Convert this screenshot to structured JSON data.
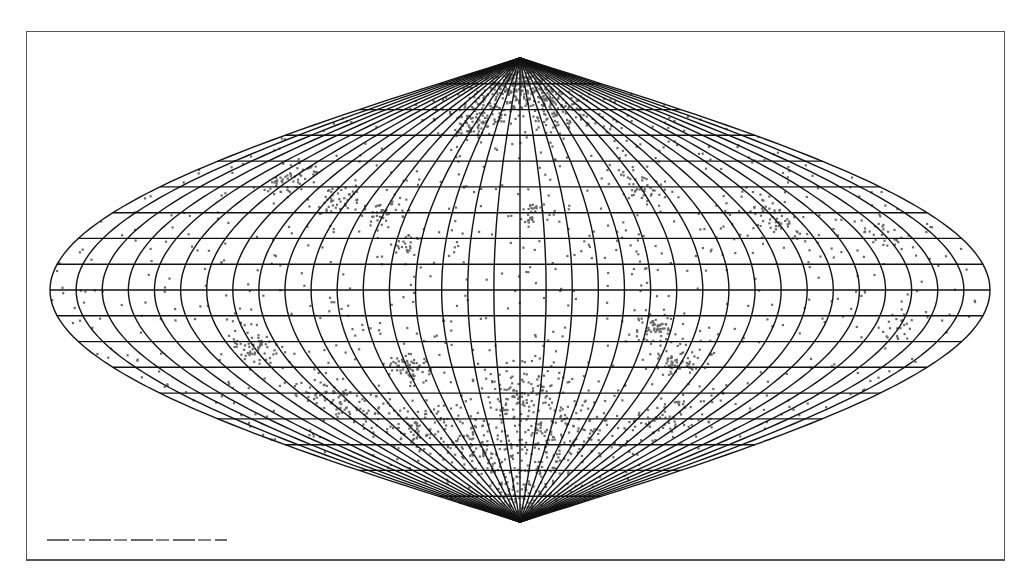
{
  "figure": {
    "caption": "Sinusoidal equal-area all-sky map with point distribution",
    "projection": "sinusoidal",
    "graticule_step_deg": 10
  },
  "layout": {
    "frame": {
      "x": 26,
      "y": 31,
      "w": 979,
      "h": 530
    },
    "center_x": 520,
    "equator_y": 290,
    "half_width": 470,
    "half_height": 232
  },
  "colors": {
    "grid": "#111111",
    "points": "#666666",
    "frame": "#555555",
    "background": "#ffffff"
  },
  "clusters": [
    {
      "lon": -10,
      "lat": 80,
      "spread": 9,
      "n": 260
    },
    {
      "lon": 15,
      "lat": 78,
      "spread": 9,
      "n": 160
    },
    {
      "lon": -40,
      "lat": 65,
      "spread": 6,
      "n": 90
    },
    {
      "lon": 40,
      "lat": 68,
      "spread": 6,
      "n": 70
    },
    {
      "lon": -120,
      "lat": 43,
      "spread": 4,
      "n": 40
    },
    {
      "lon": -85,
      "lat": 35,
      "spread": 4,
      "n": 40
    },
    {
      "lon": -60,
      "lat": 30,
      "spread": 4,
      "n": 35
    },
    {
      "lon": 5,
      "lat": 30,
      "spread": 3,
      "n": 25
    },
    {
      "lon": 110,
      "lat": 28,
      "spread": 5,
      "n": 45
    },
    {
      "lon": 60,
      "lat": 40,
      "spread": 4,
      "n": 30
    },
    {
      "lon": -45,
      "lat": 18,
      "spread": 3,
      "n": 25
    },
    {
      "lon": 55,
      "lat": -15,
      "spread": 4,
      "n": 55
    },
    {
      "lon": 70,
      "lat": -28,
      "spread": 5,
      "n": 60
    },
    {
      "lon": -50,
      "lat": -30,
      "spread": 4,
      "n": 60
    },
    {
      "lon": -110,
      "lat": -22,
      "spread": 5,
      "n": 55
    },
    {
      "lon": -95,
      "lat": -42,
      "spread": 6,
      "n": 70
    },
    {
      "lon": 0,
      "lat": -38,
      "spread": 8,
      "n": 110
    },
    {
      "lon": 30,
      "lat": -55,
      "spread": 10,
      "n": 140
    },
    {
      "lon": -30,
      "lat": -60,
      "spread": 10,
      "n": 140
    },
    {
      "lon": 0,
      "lat": -78,
      "spread": 8,
      "n": 110
    },
    {
      "lon": 90,
      "lat": -50,
      "spread": 8,
      "n": 70
    },
    {
      "lon": -70,
      "lat": -55,
      "spread": 8,
      "n": 70
    },
    {
      "lon": 150,
      "lat": 20,
      "spread": 4,
      "n": 20
    },
    {
      "lon": 150,
      "lat": -15,
      "spread": 4,
      "n": 20
    }
  ],
  "background_points": 900,
  "seed": 7
}
